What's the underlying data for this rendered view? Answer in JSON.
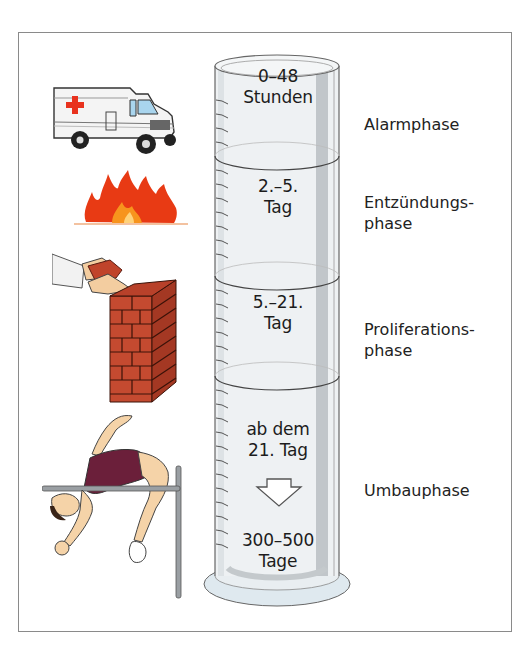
{
  "diagram": {
    "type": "phases-of-bone-healing",
    "colors": {
      "frame_border": "#8a8a8a",
      "cylinder_fill": "#eef1f3",
      "cylinder_shade": "#b9bec2",
      "cylinder_base": "#dfe9ef",
      "ambulance_cross": "#e8321e",
      "fire_red": "#e83a14",
      "fire_orange": "#f7941d",
      "brick": "#c0442b",
      "jersey": "#6b1f3a",
      "skin": "#f5d3a8"
    },
    "cylinder_sections": [
      {
        "line1": "0–48",
        "line2": "Stunden"
      },
      {
        "line1": "2.–5.",
        "line2": "Tag"
      },
      {
        "line1": "5.–21.",
        "line2": "Tag"
      },
      {
        "line1": "ab dem",
        "line2": "21. Tag"
      },
      {
        "line1": "300–500",
        "line2": "Tage"
      }
    ],
    "phases": [
      {
        "line1": "Alarmphase",
        "line2": ""
      },
      {
        "line1": "Entzündungs-",
        "line2": "phase"
      },
      {
        "line1": "Proliferations-",
        "line2": "phase"
      },
      {
        "line1": "Umbauphase",
        "line2": ""
      }
    ],
    "illustrations": [
      {
        "icon": "ambulance-icon",
        "phase": "Alarmphase"
      },
      {
        "icon": "fire-icon",
        "phase": "Entzündungsphase"
      },
      {
        "icon": "brick-wall-icon",
        "phase": "Proliferationsphase"
      },
      {
        "icon": "high-jumper-icon",
        "phase": "Umbauphase"
      }
    ],
    "arrow": "down-arrow-icon"
  }
}
